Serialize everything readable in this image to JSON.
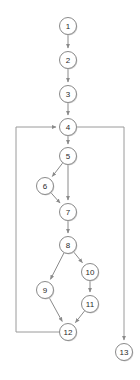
{
  "diagram": {
    "type": "directed-graph",
    "background_color": "#ffffff",
    "node_fill": "#ffffff",
    "node_stroke": "#8a8a8a",
    "edge_color": "#8a8a8a",
    "label_color": "#2b2b2b",
    "node_radius": 8.5,
    "nodes": [
      {
        "id": "1",
        "label": "1",
        "cx": 68,
        "cy": 26
      },
      {
        "id": "2",
        "label": "2",
        "cx": 68,
        "cy": 60
      },
      {
        "id": "3",
        "label": "3",
        "cx": 68,
        "cy": 94
      },
      {
        "id": "4",
        "label": "4",
        "cx": 68,
        "cy": 127
      },
      {
        "id": "5",
        "label": "5",
        "cx": 68,
        "cy": 156
      },
      {
        "id": "6",
        "label": "6",
        "cx": 45,
        "cy": 186
      },
      {
        "id": "7",
        "label": "7",
        "cx": 68,
        "cy": 212
      },
      {
        "id": "8",
        "label": "8",
        "cx": 68,
        "cy": 245
      },
      {
        "id": "9",
        "label": "9",
        "cx": 45,
        "cy": 290
      },
      {
        "id": "10",
        "label": "10",
        "cx": 90,
        "cy": 272
      },
      {
        "id": "11",
        "label": "11",
        "cx": 90,
        "cy": 304
      },
      {
        "id": "12",
        "label": "12",
        "cx": 68,
        "cy": 332
      },
      {
        "id": "13",
        "label": "13",
        "cx": 124,
        "cy": 352
      }
    ],
    "edges": [
      {
        "from": "1",
        "to": "2",
        "kind": "straight"
      },
      {
        "from": "2",
        "to": "3",
        "kind": "straight"
      },
      {
        "from": "3",
        "to": "4",
        "kind": "straight"
      },
      {
        "from": "4",
        "to": "5",
        "kind": "straight"
      },
      {
        "from": "5",
        "to": "6",
        "kind": "straight"
      },
      {
        "from": "5",
        "to": "7",
        "kind": "straight"
      },
      {
        "from": "6",
        "to": "7",
        "kind": "straight"
      },
      {
        "from": "7",
        "to": "8",
        "kind": "straight"
      },
      {
        "from": "8",
        "to": "9",
        "kind": "straight"
      },
      {
        "from": "8",
        "to": "10",
        "kind": "straight"
      },
      {
        "from": "10",
        "to": "11",
        "kind": "straight"
      },
      {
        "from": "9",
        "to": "12",
        "kind": "straight"
      },
      {
        "from": "11",
        "to": "12",
        "kind": "straight"
      },
      {
        "from": "12",
        "to": "4",
        "kind": "back-edge-left-rail"
      },
      {
        "from": "4",
        "to": "13",
        "kind": "exit-edge-right-rail"
      }
    ],
    "rails": {
      "left_rail_x": 16,
      "left_rail_top_y": 127,
      "left_rail_bottom_y": 332,
      "right_rail_x": 124,
      "right_rail_top_y": 127,
      "right_rail_bottom_y": 343
    }
  }
}
